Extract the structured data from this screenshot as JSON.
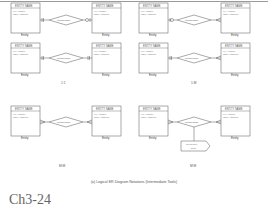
{
  "entity_box": {
    "name": "ENTITY NAME",
    "attr1": "Key Attribute",
    "attr2": "Other Attributes"
  },
  "entity_label": "Entity",
  "relationship_label": "Relationship",
  "intersection_label_1": "Intersection",
  "intersection_label_2": "Data",
  "cardinality_captions": {
    "one_to_one": "1:1",
    "one_to_many": "1:M",
    "many_to_many_left": "M:M",
    "many_to_many_right": "M:M"
  },
  "figure_caption": "(a)   Logical ER Diagram Notations (Intermediate Tools)",
  "slide_label": "Ch3-24"
}
